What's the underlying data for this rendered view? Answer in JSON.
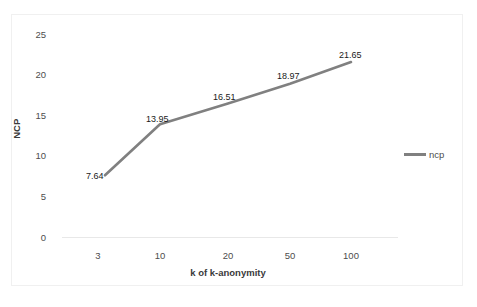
{
  "chart_data": {
    "type": "line",
    "title": "",
    "xlabel": "k of k-anonymity",
    "ylabel": "NCP",
    "categories": [
      "3",
      "10",
      "20",
      "50",
      "100"
    ],
    "x": [
      3,
      10,
      20,
      50,
      100
    ],
    "series": [
      {
        "name": "ncp",
        "values": [
          7.64,
          13.95,
          16.51,
          18.97,
          21.65
        ],
        "color": "#808080"
      }
    ],
    "data_labels": [
      "7.64",
      "13.95",
      "16.51",
      "18.97",
      "21.65"
    ],
    "ylim": [
      0,
      25
    ],
    "yticks": [
      0,
      5,
      10,
      15,
      20,
      25
    ],
    "ytick_labels": [
      "0",
      "5",
      "10",
      "15",
      "20",
      "25"
    ],
    "xtick_labels": [
      "3",
      "10",
      "20",
      "50",
      "100"
    ],
    "grid": false,
    "legend": {
      "position": "right",
      "entries": [
        "ncp"
      ]
    },
    "colors": {
      "line": "#808080",
      "axis": "#e0e0e0",
      "border": "#f0f0f0",
      "tick_text": "#4d4d4d",
      "label_text": "#1a1a1a"
    }
  },
  "legend": {
    "series_label": "ncp"
  },
  "axes": {
    "y_title": "NCP",
    "x_title": "k of k-anonymity",
    "y_ticks": [
      "25",
      "20",
      "15",
      "10",
      "5",
      "0"
    ],
    "x_ticks": [
      "3",
      "10",
      "20",
      "50",
      "100"
    ]
  },
  "labels": {
    "p0": "7.64",
    "p1": "13.95",
    "p2": "16.51",
    "p3": "18.97",
    "p4": "21.65"
  }
}
